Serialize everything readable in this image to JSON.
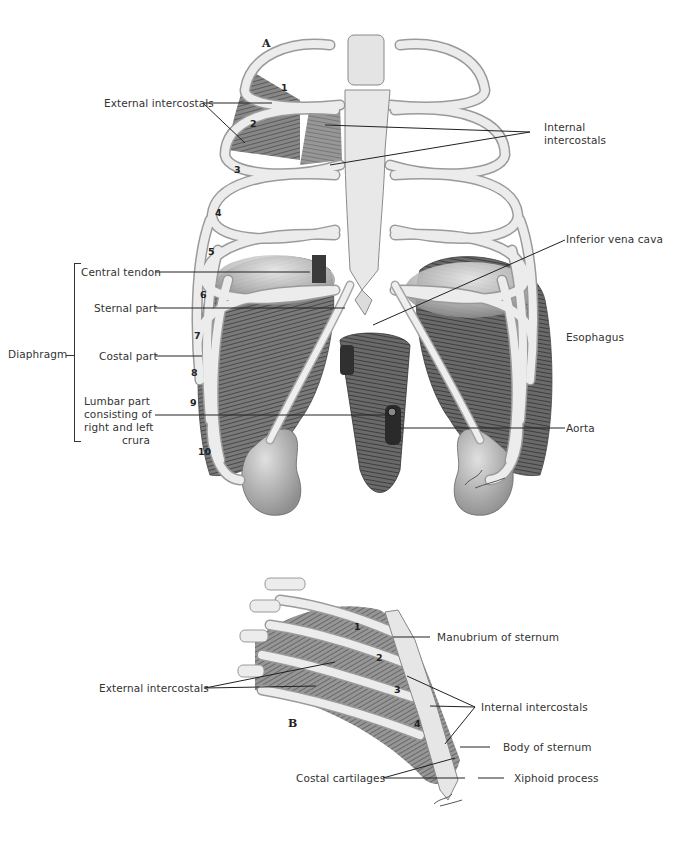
{
  "figure_a": {
    "panel_letter": "A",
    "labels": {
      "external_intercostals": "External intercostals",
      "internal_intercostals_line1": "Internal",
      "internal_intercostals_line2": "intercostals",
      "inferior_vena_cava": "Inferior vena cava",
      "central_tendon": "Central tendon",
      "sternal_part": "Sternal part",
      "diaphragm": "Diaphragm",
      "costal_part": "Costal part",
      "esophagus": "Esophagus",
      "lumbar_part_line1": "Lumbar part",
      "lumbar_part_line2": "consisting of",
      "lumbar_part_line3": "right and left",
      "lumbar_part_line4": "crura",
      "aorta": "Aorta"
    },
    "rib_numbers": [
      "1",
      "2",
      "3",
      "4",
      "5",
      "6",
      "7",
      "8",
      "9",
      "10"
    ]
  },
  "figure_b": {
    "panel_letter": "B",
    "labels": {
      "manubrium": "Manubrium of sternum",
      "external_intercostals": "External intercostals",
      "internal_intercostals": "Internal intercostals",
      "body_of_sternum": "Body of sternum",
      "costal_cartilages": "Costal cartilages",
      "xiphoid_process": "Xiphoid process"
    },
    "rib_numbers": [
      "1",
      "2",
      "3",
      "4"
    ]
  },
  "colors": {
    "bone": "#e9e9e9",
    "bone_shade": "#bdbdbd",
    "muscle": "#5a5a5a",
    "muscle_dark": "#2e2e2e",
    "leader_line": "#222222",
    "background": "#ffffff"
  }
}
